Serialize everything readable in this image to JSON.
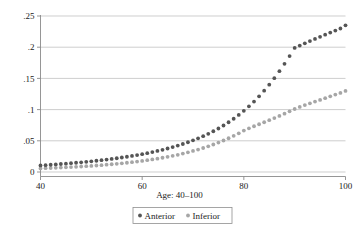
{
  "chart_data": {
    "type": "scatter",
    "title": "",
    "subtitle": "",
    "xlabel": "Age: 40–100",
    "ylabel": "",
    "xlim": [
      40,
      100
    ],
    "ylim": [
      0,
      0.25
    ],
    "grid": "horizontal",
    "legend_position": "bottom",
    "x_ticks": [
      40,
      60,
      80,
      100
    ],
    "x_tick_labels": [
      "40",
      "60",
      "80",
      "100"
    ],
    "y_ticks": [
      0,
      0.05,
      0.1,
      0.15,
      0.2,
      0.25
    ],
    "y_tick_labels": [
      "0",
      ".05",
      ".1",
      ".15",
      ".2",
      ".25"
    ],
    "x": [
      40,
      41,
      42,
      43,
      44,
      45,
      46,
      47,
      48,
      49,
      50,
      51,
      52,
      53,
      54,
      55,
      56,
      57,
      58,
      59,
      60,
      61,
      62,
      63,
      64,
      65,
      66,
      67,
      68,
      69,
      70,
      71,
      72,
      73,
      74,
      75,
      76,
      77,
      78,
      79,
      80,
      81,
      82,
      83,
      84,
      85,
      86,
      87,
      88,
      89,
      90,
      91,
      92,
      93,
      94,
      95,
      96,
      97,
      98,
      99,
      100
    ],
    "series": [
      {
        "name": "Anterior",
        "color": "#555555",
        "marker": "circle",
        "values": [
          0.0105,
          0.011,
          0.0116,
          0.0122,
          0.0128,
          0.0134,
          0.0141,
          0.0148,
          0.0155,
          0.0163,
          0.0171,
          0.018,
          0.0189,
          0.0199,
          0.0209,
          0.022,
          0.0232,
          0.0244,
          0.0257,
          0.0271,
          0.0286,
          0.0302,
          0.0319,
          0.0337,
          0.0356,
          0.0377,
          0.0399,
          0.0423,
          0.0449,
          0.0477,
          0.0507,
          0.0539,
          0.0574,
          0.0612,
          0.0653,
          0.0697,
          0.0745,
          0.0797,
          0.0853,
          0.0914,
          0.098,
          0.1052,
          0.1129,
          0.1213,
          0.1303,
          0.14,
          0.1504,
          0.1615,
          0.1733,
          0.1858,
          0.1989,
          0.2026,
          0.2062,
          0.2098,
          0.2133,
          0.2167,
          0.2201,
          0.2234,
          0.2266,
          0.23,
          0.235
        ]
      },
      {
        "name": "Inferior",
        "color": "#a6a6a6",
        "marker": "circle",
        "values": [
          0.0058,
          0.0061,
          0.0064,
          0.0067,
          0.0071,
          0.0075,
          0.0079,
          0.0083,
          0.0088,
          0.0093,
          0.0098,
          0.0104,
          0.011,
          0.0117,
          0.0124,
          0.0131,
          0.0139,
          0.0148,
          0.0157,
          0.0167,
          0.0177,
          0.0189,
          0.0201,
          0.0214,
          0.0228,
          0.0243,
          0.0259,
          0.0276,
          0.0295,
          0.0315,
          0.0337,
          0.036,
          0.0385,
          0.0412,
          0.0441,
          0.0472,
          0.0505,
          0.0541,
          0.0579,
          0.062,
          0.0664,
          0.07,
          0.0733,
          0.0765,
          0.0797,
          0.083,
          0.0864,
          0.0899,
          0.0935,
          0.0972,
          0.101,
          0.1043,
          0.1073,
          0.11,
          0.1128,
          0.1155,
          0.1183,
          0.1212,
          0.124,
          0.1268,
          0.13
        ]
      }
    ]
  },
  "legend": {
    "items": [
      {
        "label": "Anterior",
        "color": "#555555"
      },
      {
        "label": "Inferior",
        "color": "#a6a6a6"
      }
    ]
  },
  "axis": {
    "x_title": "Age: 40–100"
  }
}
